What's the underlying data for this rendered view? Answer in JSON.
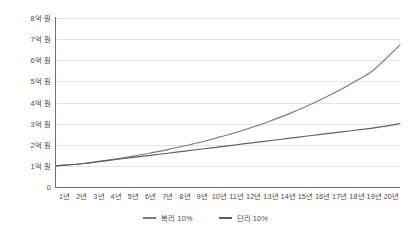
{
  "chart_data": {
    "type": "line",
    "title": "",
    "xlabel": "",
    "ylabel": "",
    "grid": true,
    "legend_position": "bottom",
    "x": [
      "1년",
      "2년",
      "3년",
      "4년",
      "5년",
      "6년",
      "7년",
      "8년",
      "9년",
      "10년",
      "11년",
      "12년",
      "13년",
      "14년",
      "15년",
      "16년",
      "17년",
      "18년",
      "19년",
      "20년"
    ],
    "categories": [
      "1년",
      "2년",
      "3년",
      "4년",
      "5년",
      "6년",
      "7년",
      "8년",
      "9년",
      "10년",
      "11년",
      "12년",
      "13년",
      "14년",
      "15년",
      "16년",
      "17년",
      "18년",
      "19년",
      "20년"
    ],
    "ylim": [
      0,
      8
    ],
    "yticks": [
      0,
      1,
      2,
      3,
      4,
      5,
      6,
      7,
      8
    ],
    "ytick_labels": [
      "0",
      "1억 원",
      "2억 원",
      "3억 원",
      "4억 원",
      "5억 원",
      "6억 원",
      "7억 원",
      "8억 원"
    ],
    "unit_note": "억 원",
    "series": [
      {
        "name": "복리 10%",
        "color": "#7a7a7a",
        "values": [
          1.0,
          1.1,
          1.21,
          1.33,
          1.46,
          1.61,
          1.77,
          1.95,
          2.14,
          2.36,
          2.59,
          2.85,
          3.14,
          3.45,
          3.8,
          4.18,
          4.59,
          5.05,
          5.56,
          6.73
        ]
      },
      {
        "name": "단리 10%",
        "color": "#5f5f5f",
        "values": [
          1.0,
          1.1,
          1.2,
          1.3,
          1.4,
          1.5,
          1.6,
          1.7,
          1.8,
          1.9,
          2.0,
          2.1,
          2.2,
          2.3,
          2.4,
          2.5,
          2.6,
          2.7,
          2.8,
          3.0
        ]
      }
    ]
  },
  "legend": {
    "items": [
      {
        "label": "복리 10%",
        "color": "#7a7a7a"
      },
      {
        "label": "단리 10%",
        "color": "#5f5f5f"
      }
    ]
  },
  "axes": {
    "y_labels": [
      "8억 원",
      "7억 원",
      "6억 원",
      "5억 원",
      "4억 원",
      "3억 원",
      "2억 원",
      "1억 원",
      "0"
    ],
    "x_labels": [
      "1년",
      "2년",
      "3년",
      "4년",
      "5년",
      "6년",
      "7년",
      "8년",
      "9년",
      "10년",
      "11년",
      "12년",
      "13년",
      "14년",
      "15년",
      "16년",
      "17년",
      "18년",
      "19년",
      "20년"
    ]
  },
  "colors": {
    "grid": "#e4e4e4",
    "axis": "#6f6f6f",
    "text": "#4a4a4a",
    "background": "#ffffff"
  }
}
